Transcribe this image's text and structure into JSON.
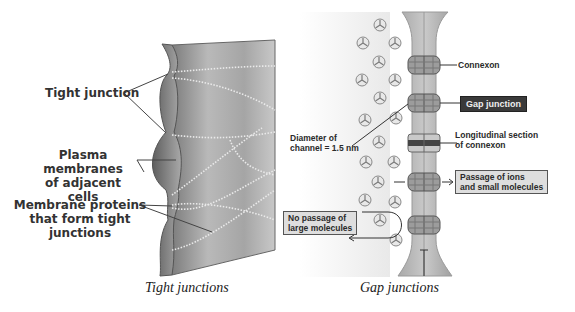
{
  "left_panel": {
    "caption": "Tight junctions",
    "labels": {
      "tight_junction": "Tight junction",
      "plasma_membranes_1": "Plasma membranes",
      "plasma_membranes_2": "of adjacent cells",
      "membrane_proteins_1": "Membrane proteins",
      "membrane_proteins_2": "that form tight junctions"
    }
  },
  "right_panel": {
    "caption": "Gap junctions",
    "labels": {
      "connexon": "Connexon",
      "gap_junction": "Gap junction",
      "diameter_1": "Diameter of",
      "diameter_2": "channel = 1.5 nm",
      "longitudinal_1": "Longitudinal section",
      "longitudinal_2": "of connexon",
      "passage_1": "Passage of ions",
      "passage_2": "and small molecules",
      "no_passage_1": "No passage of",
      "no_passage_2": "large molecules"
    }
  },
  "colors": {
    "background": "#ffffff",
    "membrane_gray": "#9a9a9a",
    "dark_label_bg": "#3a3a3a",
    "light_label_bg": "#dedede"
  }
}
